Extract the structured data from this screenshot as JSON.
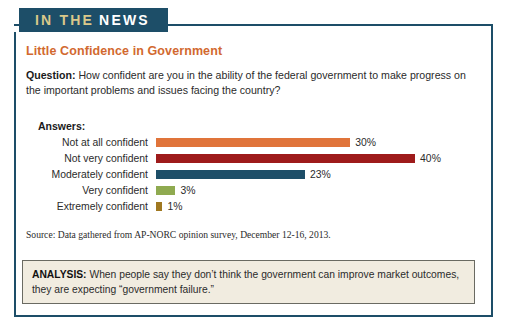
{
  "banner": {
    "text_part1": "IN THE",
    "text_part2": "NEWS"
  },
  "title": "Little Confidence in Government",
  "question": {
    "label": "Question:",
    "text": " How confident are you in the ability of the federal government to make progress on the important problems and issues facing the country?"
  },
  "chart_data": {
    "type": "bar",
    "orientation": "horizontal",
    "title": "Little Confidence in Government",
    "axis_label": "Answers:",
    "categories": [
      "Not at all confident",
      "Not very confident",
      "Moderately confident",
      "Very confident",
      "Extremely confident"
    ],
    "values": [
      30,
      40,
      23,
      3,
      1
    ],
    "value_labels": [
      "30%",
      "40%",
      "23%",
      "3%",
      "1%"
    ],
    "colors": [
      "#e0743a",
      "#9e1b1b",
      "#1d4e68",
      "#8faa50",
      "#a07820"
    ],
    "xlabel": "",
    "ylabel": "",
    "xlim": [
      0,
      44
    ],
    "grid": false,
    "legend": false,
    "units": "percent"
  },
  "source": "Source: Data gathered from AP-NORC opinion survey, December 12-16, 2013.",
  "analysis": {
    "label": "ANALYSIS:",
    "text": " When people say they don’t think the government can improve market outcomes, they are expecting “government failure.”"
  },
  "colors": {
    "navy": "#1d4e68",
    "orange_title": "#d2692f",
    "banner_gold": "#d9c88a",
    "analysis_bg": "#f1ece0"
  }
}
